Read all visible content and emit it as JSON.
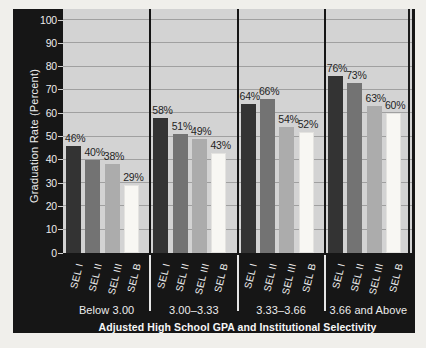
{
  "chart_data": {
    "type": "bar",
    "categories": [
      "Below 3.00",
      "3.00–3.33",
      "3.33–3.66",
      "3.66 and Above"
    ],
    "series": [
      {
        "name": "SEL I",
        "values": [
          46,
          58,
          64,
          76
        ]
      },
      {
        "name": "SEL II",
        "values": [
          40,
          51,
          66,
          73
        ]
      },
      {
        "name": "SEL III",
        "values": [
          38,
          49,
          54,
          63
        ]
      },
      {
        "name": "SEL B",
        "values": [
          29,
          43,
          52,
          60
        ]
      }
    ],
    "value_label_suffix": "%",
    "title": "",
    "xlabel": "Adjusted High School GPA and Institutional Selectivity",
    "ylabel": "Graduation Rate (Percent)",
    "ylim": [
      0,
      100
    ],
    "yticks": [
      0,
      10,
      20,
      30,
      40,
      50,
      60,
      70,
      80,
      90,
      100
    ],
    "grid": true,
    "legend": false,
    "bar_colors": [
      "#333333",
      "#737373",
      "#acacac",
      "#f8f7f3"
    ]
  },
  "theme": {
    "page_bg": "#f0efeb",
    "frame_bg": "#161616",
    "plot_bg": "#d3d3d3",
    "gridline": "#a0a0a0",
    "axis_text": "#ececec",
    "value_label": "#1f1f1f",
    "divider": "#e6e6e6"
  }
}
